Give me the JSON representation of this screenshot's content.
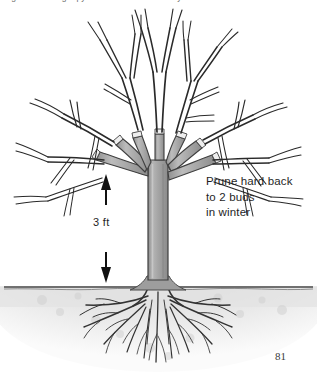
{
  "page": {
    "number": "81",
    "caption_clipped": "Fig. 00: Training a pyramid tree — first three years",
    "background_color": "#ffffff"
  },
  "figure": {
    "annotations": {
      "prune_note": {
        "line1": "Prune hard back",
        "line2": "to 2 buds",
        "line3": "in winter"
      },
      "height_label": "3 ft"
    },
    "arrows": {
      "up": "arrow-up",
      "down": "arrow-down"
    },
    "parts": {
      "canopy": "bare-branch-canopy",
      "scaffold_stubs": "pruned-scaffold-branches",
      "trunk": "tree-trunk",
      "ground_line": "soil-surface-line",
      "soil": "soil-band",
      "roots": "root-system"
    }
  },
  "colors": {
    "ink": "#1f1f1f",
    "trunk_fill": "#a8a8a8",
    "trunk_shade": "#8f8f8f",
    "trunk_light": "#c4c4c4",
    "cut_face": "#ededed",
    "soil": "#dcdcdc",
    "soil_light": "#ebebeb",
    "ground_line": "#4a4a4a",
    "branch_stroke": "#2a2a2a",
    "root_stroke": "#333333",
    "caption": "#6a6a6a"
  }
}
